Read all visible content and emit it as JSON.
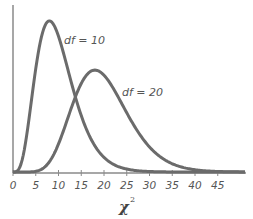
{
  "chart_data": {
    "type": "line",
    "title": "",
    "xlabel": "χ",
    "xlabel_superscript": "2",
    "ylabel": "",
    "xlim": [
      0,
      50
    ],
    "x_ticks": [
      0,
      5,
      10,
      15,
      20,
      25,
      30,
      35,
      40,
      45
    ],
    "x_tick_labels": [
      "0",
      "5",
      "10",
      "15",
      "20",
      "25",
      "30",
      "35",
      "40",
      "45"
    ],
    "grid": false,
    "legend": "none (inline labels)",
    "series": [
      {
        "name": "df = 10",
        "df": 10,
        "label": "df = 10",
        "mode": 8,
        "peak_density": 0.098,
        "description": "Chi-square density with 10 degrees of freedom"
      },
      {
        "name": "df = 20",
        "df": 20,
        "label": "df = 20",
        "mode": 18,
        "peak_density": 0.066,
        "description": "Chi-square density with 20 degrees of freedom"
      }
    ],
    "colors": {
      "curve": "#6b6b6b",
      "axis": "#8a8a8a",
      "text": "#555555"
    }
  }
}
